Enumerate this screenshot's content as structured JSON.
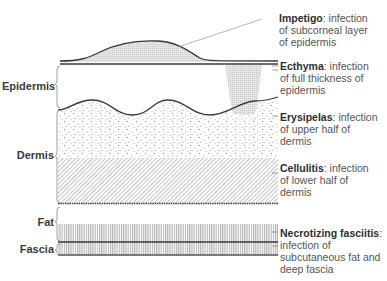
{
  "figure": {
    "type": "skin-infection-depth-diagram",
    "layers": [
      {
        "id": "epidermis",
        "label": "Epidermis"
      },
      {
        "id": "dermis",
        "label": "Dermis"
      },
      {
        "id": "fat",
        "label": "Fat"
      },
      {
        "id": "fascia",
        "label": "Fascia"
      }
    ],
    "annotations": [
      {
        "id": "impetigo",
        "term": "Impetigo",
        "sep": ":",
        "line1": " infection",
        "line2": "of  subcorneal layer",
        "line3": "of epidermis"
      },
      {
        "id": "ecthyma",
        "term": "Ecthyma",
        "sep": ":",
        "line1": " infection",
        "line2": "of full thickness of",
        "line3": "epidermis"
      },
      {
        "id": "erysipelas",
        "term": "Erysipelas",
        "sep": ":",
        "line1": " infection",
        "line2": "of upper half of",
        "line3": "dermis"
      },
      {
        "id": "cellulitis",
        "term": "Cellulitis",
        "sep": ":",
        "line1": " infection",
        "line2": "of  lower half of",
        "line3": "dermis"
      },
      {
        "id": "necrotizing-fasciitis",
        "term": "Necrotizing fasciitis",
        "sep": ":",
        "line1": "infection of",
        "line2": "subcutaneous fat and",
        "line3": "deep fascia"
      }
    ],
    "colors": {
      "line": "#3a3a3a",
      "shade": "#d8d8d8",
      "dot": "#777777",
      "hatch": "#9a9a9a"
    }
  }
}
